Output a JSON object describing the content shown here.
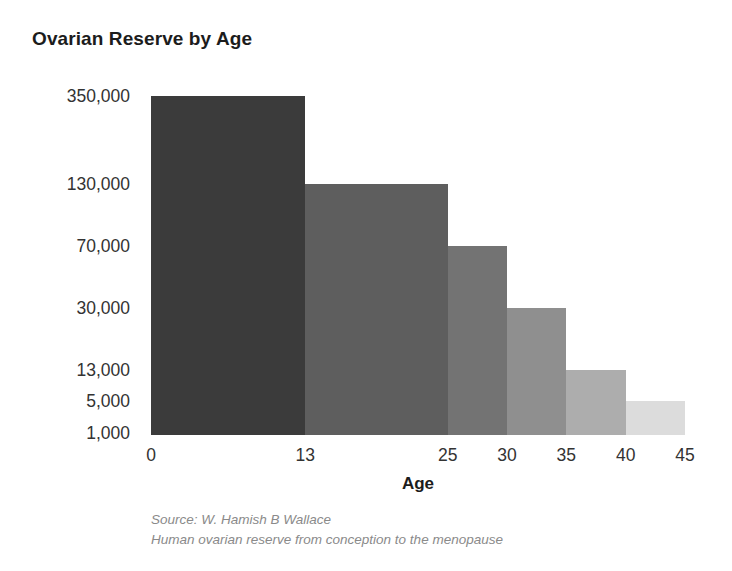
{
  "chart_data": {
    "type": "bar",
    "title": "Ovarian Reserve by Age",
    "xlabel": "Age",
    "ylabel": "",
    "grid": false,
    "legend": null,
    "x_tick_labels": [
      "0",
      "13",
      "25",
      "30",
      "35",
      "40",
      "45"
    ],
    "x_tick_values": [
      0,
      13,
      25,
      30,
      35,
      40,
      45
    ],
    "y_tick_labels": [
      "350,000",
      "130,000",
      "70,000",
      "30,000",
      "13,000",
      "5,000",
      "1,000"
    ],
    "y_tick_values": [
      350000,
      130000,
      70000,
      30000,
      13000,
      5000,
      1000
    ],
    "y_scale": "log-like-custom",
    "categories": [
      "0–13",
      "13–25",
      "25–30",
      "30–35",
      "35–40",
      "40–45"
    ],
    "values": [
      350000,
      130000,
      70000,
      30000,
      13000,
      5000
    ],
    "bars": [
      {
        "label": "0–13",
        "x_start": 0,
        "x_end": 13,
        "value": 350000,
        "value_label": "350,000",
        "color": "#3b3b3b"
      },
      {
        "label": "13–25",
        "x_start": 13,
        "x_end": 25,
        "value": 130000,
        "value_label": "130,000",
        "color": "#5e5e5e"
      },
      {
        "label": "25–30",
        "x_start": 25,
        "x_end": 30,
        "value": 70000,
        "value_label": "70,000",
        "color": "#737373"
      },
      {
        "label": "30–35",
        "x_start": 30,
        "x_end": 35,
        "value": 30000,
        "value_label": "30,000",
        "color": "#8f8f8f"
      },
      {
        "label": "35–40",
        "x_start": 35,
        "x_end": 40,
        "value": 13000,
        "value_label": "13,000",
        "color": "#adadad"
      },
      {
        "label": "40–45",
        "x_start": 40,
        "x_end": 45,
        "value": 5000,
        "value_label": "5,000",
        "color": "#dcdcdc"
      }
    ],
    "baseline_value": 1000,
    "annotations": []
  },
  "source": {
    "line1": "Source: W. Hamish B Wallace",
    "line2": "Human ovarian reserve from conception to the menopause"
  },
  "colors": {
    "background": "#ffffff",
    "title_text": "#1c1c1c",
    "tick_text": "#333333",
    "source_text": "#8a8a8a"
  }
}
